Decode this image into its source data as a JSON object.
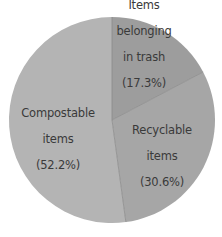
{
  "chart_data": {
    "type": "pie",
    "title": "",
    "start_angle_deg": 0,
    "direction": "clockwise",
    "center": [
      112,
      120
    ],
    "radius": 103,
    "categories": [
      "Items belonging in trash",
      "Recyclable items",
      "Compostable items"
    ],
    "values": [
      17.3,
      30.6,
      52.2
    ],
    "unit": "%",
    "colors": [
      "#9d9d9d",
      "#a6a6a6",
      "#b4b4b4"
    ],
    "slices": [
      {
        "name": "Items belonging in trash",
        "value": 17.3,
        "label_lines": [
          "Items",
          "belonging",
          "in trash",
          "(17.3%)"
        ],
        "color": "#9d9d9d",
        "label_pos": [
          144,
          38
        ]
      },
      {
        "name": "Recyclable items",
        "value": 30.6,
        "label_lines": [
          "Recyclable",
          "items",
          "(30.6%)"
        ],
        "color": "#a6a6a6",
        "label_pos": [
          162,
          150
        ]
      },
      {
        "name": "Compostable items",
        "value": 52.2,
        "label_lines": [
          "Compostable",
          "items",
          "(52.2%)"
        ],
        "color": "#b4b4b4",
        "label_pos": [
          58,
          133
        ]
      }
    ],
    "divider_color": "#8a8a8a",
    "label_color": "#3a3a3a",
    "legend": "none (labels drawn inside slices)"
  }
}
